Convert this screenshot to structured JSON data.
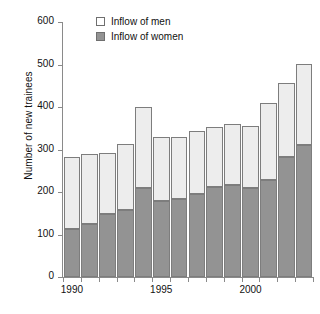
{
  "chart_data": {
    "type": "bar",
    "stacked": true,
    "title": "",
    "xlabel": "",
    "ylabel": "Number of new trainees",
    "ylim": [
      0,
      600
    ],
    "yticks": [
      0,
      100,
      200,
      300,
      400,
      500,
      600
    ],
    "ytick_labels": [
      "0",
      "100",
      "200",
      "300",
      "400",
      "500",
      "600"
    ],
    "grid": false,
    "legend_position": "top-center",
    "categories": [
      1990,
      1991,
      1992,
      1993,
      1994,
      1995,
      1996,
      1997,
      1998,
      1999,
      2000,
      2001,
      2002,
      2003
    ],
    "xtick_values": [
      1990,
      1995,
      2000
    ],
    "xtick_labels": [
      "1990",
      "1995",
      "2000"
    ],
    "series": [
      {
        "name": "Inflow of women",
        "color": "#939393",
        "values": [
          112,
          124,
          149,
          158,
          209,
          178,
          184,
          195,
          212,
          216,
          209,
          229,
          282,
          310
        ]
      },
      {
        "name": "Inflow of men",
        "color": "#ededed",
        "values": [
          170,
          165,
          143,
          155,
          192,
          152,
          146,
          148,
          140,
          143,
          147,
          180,
          174,
          191
        ]
      }
    ],
    "totals": [
      282,
      289,
      292,
      313,
      401,
      330,
      330,
      343,
      352,
      359,
      356,
      409,
      456,
      501
    ]
  },
  "legend": {
    "items": [
      {
        "label": "Inflow of men",
        "swatch": "legend-swatch-men"
      },
      {
        "label": "Inflow of women",
        "swatch": "legend-swatch-women"
      }
    ]
  }
}
